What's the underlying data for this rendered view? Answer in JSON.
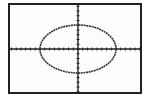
{
  "chart_data": {
    "type": "line",
    "title": "",
    "xlabel": "",
    "ylabel": "",
    "curve": {
      "shape": "ellipse",
      "center": [
        0,
        0
      ],
      "x_radius_ticks": 8,
      "y_radius_ticks": 6
    },
    "xlim": [
      -10,
      10
    ],
    "ylim": [
      -10,
      10
    ],
    "x_ticks": 20,
    "y_ticks": 20,
    "grid": false,
    "colors": {
      "curve": "#333333",
      "axes": "#222222",
      "frame": "#222222"
    }
  }
}
